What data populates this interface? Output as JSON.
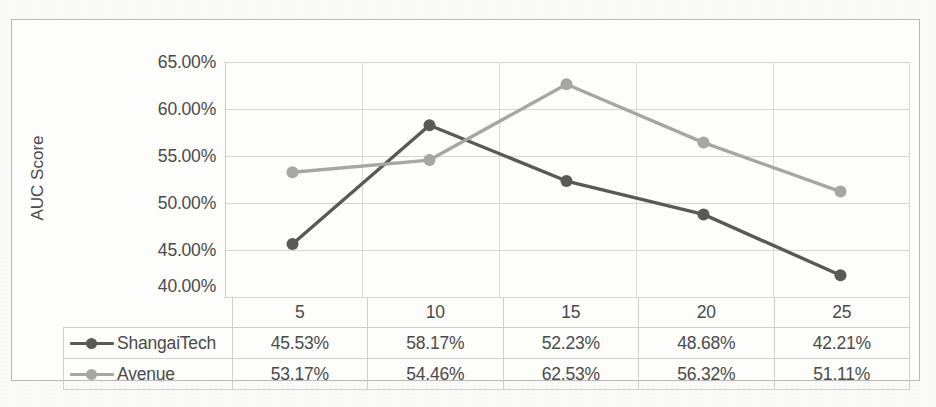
{
  "chart_data": {
    "type": "line",
    "title": "",
    "xlabel": "",
    "ylabel": "AUC Score",
    "categories": [
      "5",
      "10",
      "15",
      "20",
      "25"
    ],
    "ylim": [
      40,
      65
    ],
    "ytick_labels": [
      "65.00%",
      "60.00%",
      "55.00%",
      "50.00%",
      "45.00%",
      "40.00%"
    ],
    "ytick_values": [
      65,
      60,
      55,
      50,
      45,
      40
    ],
    "grid": true,
    "legend_position": "bottom-table",
    "series": [
      {
        "name": "ShangaiTech",
        "color": "#595959",
        "values": [
          45.53,
          58.17,
          52.23,
          48.68,
          42.21
        ],
        "labels": [
          "45.53%",
          "58.17%",
          "52.23%",
          "48.68%",
          "42.21%"
        ]
      },
      {
        "name": "Avenue",
        "color": "#a6a6a6",
        "values": [
          53.17,
          54.46,
          62.53,
          56.32,
          51.11
        ],
        "labels": [
          "53.17%",
          "54.46%",
          "62.53%",
          "56.32%",
          "51.11%"
        ]
      }
    ]
  },
  "table": {
    "header": [
      "",
      "5",
      "10",
      "15",
      "20",
      "25"
    ],
    "rows": [
      {
        "label": "ShangaiTech",
        "cells": [
          "45.53%",
          "58.17%",
          "52.23%",
          "48.68%",
          "42.21%"
        ]
      },
      {
        "label": "Avenue",
        "cells": [
          "53.17%",
          "54.46%",
          "62.53%",
          "56.32%",
          "51.11%"
        ]
      }
    ]
  }
}
